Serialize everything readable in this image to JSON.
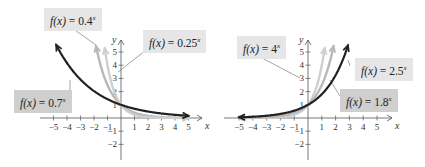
{
  "chart_data": [
    {
      "type": "line",
      "title": "Exponential decay functions",
      "xlabel": "x",
      "ylabel": "y",
      "xlim": [
        -5,
        5
      ],
      "ylim": [
        -2,
        5
      ],
      "x_ticks": [
        "-5",
        "-4",
        "-3",
        "-2",
        "-1",
        "1",
        "2",
        "3",
        "4",
        "5"
      ],
      "y_ticks": [
        "-2",
        "-1",
        "1",
        "2",
        "3",
        "4",
        "5"
      ],
      "grid": false,
      "series": [
        {
          "name": "f(x) = 0.7^x",
          "base": 0.7,
          "color": "#222222",
          "label_text": "f(x) = 0.7",
          "exponent": "x"
        },
        {
          "name": "f(x) = 0.4^x",
          "base": 0.4,
          "color": "#b8b8b8",
          "label_text": "f(x) = 0.4",
          "exponent": "x"
        },
        {
          "name": "f(x) = 0.25^x",
          "base": 0.25,
          "color": "#cfcfcf",
          "label_text": "f(x) = 0.25",
          "exponent": "x"
        }
      ]
    },
    {
      "type": "line",
      "title": "Exponential growth functions",
      "xlabel": "x",
      "ylabel": "y",
      "xlim": [
        -5,
        5
      ],
      "ylim": [
        -2,
        5
      ],
      "x_ticks": [
        "-5",
        "-4",
        "-3",
        "-2",
        "-1",
        "1",
        "2",
        "3",
        "4",
        "5"
      ],
      "y_ticks": [
        "-2",
        "-1",
        "1",
        "2",
        "3",
        "4",
        "5"
      ],
      "grid": false,
      "series": [
        {
          "name": "f(x) = 4^x",
          "base": 4,
          "color": "#cfcfcf",
          "label_text": "f(x) = 4",
          "exponent": "x"
        },
        {
          "name": "f(x) = 2.5^x",
          "base": 2.5,
          "color": "#b8b8b8",
          "label_text": "f(x) = 2.5",
          "exponent": "x"
        },
        {
          "name": "f(x) = 1.8^x",
          "base": 1.8,
          "color": "#222222",
          "label_text": "f(x) = 1.8",
          "exponent": "x"
        }
      ]
    }
  ],
  "labels": {
    "left": {
      "a": {
        "fx": "f(x)",
        "rest": " = 0.4",
        "exp": "x"
      },
      "b": {
        "fx": "f(x)",
        "rest": " = 0.25",
        "exp": "x"
      },
      "c": {
        "fx": "f(x)",
        "rest": " = 0.7",
        "exp": "x"
      }
    },
    "right": {
      "a": {
        "fx": "f(x)",
        "rest": " = 4",
        "exp": "x"
      },
      "b": {
        "fx": "f(x)",
        "rest": " = 2.5",
        "exp": "x"
      },
      "c": {
        "fx": "f(x)",
        "rest": " = 1.8",
        "exp": "x"
      }
    }
  }
}
